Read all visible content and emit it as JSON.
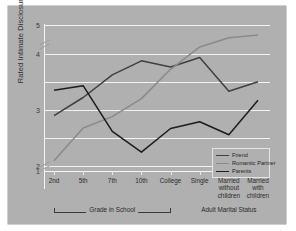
{
  "chart_data": {
    "type": "line",
    "title": "",
    "xlabel": "",
    "ylabel": "Rated Intimate Disclosure",
    "ylim": [
      1,
      5
    ],
    "yticks": [
      1,
      2,
      3,
      4,
      5
    ],
    "gridlines": [
      2.0,
      2.5,
      3.0,
      3.5,
      4.0,
      5.0
    ],
    "grid": true,
    "axis_break": true,
    "legend_position": "bottom-right",
    "categories": [
      "2nd",
      "5th",
      "7th",
      "10th",
      "College",
      "Single",
      "Married\nwithout\nchildren",
      "Married\nwith\nchildren"
    ],
    "group_brackets": [
      {
        "label": "Grade in School",
        "from": 0,
        "to": 4
      },
      {
        "label": "Adult Marital Status",
        "from": 5,
        "to": 7
      }
    ],
    "series": [
      {
        "name": "Friend",
        "color": "#404040",
        "values": [
          2.9,
          3.22,
          3.62,
          3.87,
          3.76,
          3.93,
          3.33,
          3.5
        ]
      },
      {
        "name": "Romantic Partner",
        "color": "#8a8a8a",
        "values": [
          2.1,
          2.68,
          2.88,
          3.2,
          3.72,
          4.23,
          4.55,
          4.65
        ]
      },
      {
        "name": "Parents",
        "color": "#1c1c1c",
        "values": [
          3.35,
          3.43,
          2.62,
          2.25,
          2.67,
          2.79,
          2.56,
          3.17
        ]
      }
    ]
  },
  "figure": {
    "background": "#b0b0b0",
    "grid_color": "#f2f2f2",
    "text_color": "#2b2b2b"
  }
}
